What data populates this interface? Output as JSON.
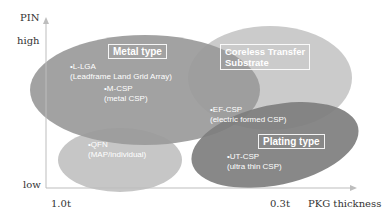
{
  "axes": {
    "y_title": "PIN",
    "y_high": "high",
    "y_low": "low",
    "x_start": "1.0t",
    "x_end": "0.3t",
    "x_title": "PKG thickness"
  },
  "groups": {
    "metal": {
      "title": "Metal type",
      "color": "#8c8c8c",
      "items": [
        {
          "name": "•L-LGA",
          "desc": "(Leadframe Land Grid Array)"
        },
        {
          "name": "•M-CSP",
          "desc": "(metal CSP)"
        }
      ]
    },
    "coreless": {
      "title_line1": "Coreless Transfer",
      "title_line2": "Substrate",
      "color": "#c8c8c8",
      "items": [
        {
          "name": "•EF-CSP",
          "desc": "(electric formed CSP)"
        }
      ]
    },
    "plating": {
      "title": "Plating type",
      "color": "#7a7a7a",
      "items": [
        {
          "name": "•UT-CSP",
          "desc": "(ultra thin CSP)"
        }
      ]
    },
    "qfn": {
      "color": "#c4c4c4",
      "items": [
        {
          "name": "•QFN",
          "desc": "(MAP/individual)"
        }
      ]
    }
  }
}
